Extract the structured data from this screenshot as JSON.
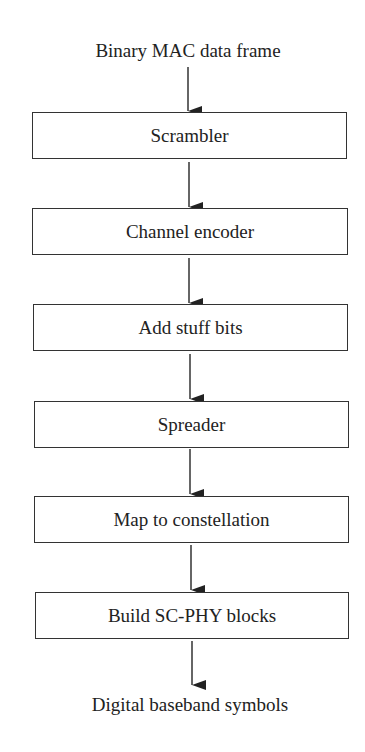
{
  "diagram": {
    "input_label": "Binary MAC data frame",
    "output_label": "Digital baseband symbols",
    "steps": [
      {
        "label": "Scrambler"
      },
      {
        "label": "Channel encoder"
      },
      {
        "label": "Add stuff bits"
      },
      {
        "label": "Spreader"
      },
      {
        "label": "Map to constellation"
      },
      {
        "label": "Build SC-PHY blocks"
      }
    ],
    "colors": {
      "line": "#333333",
      "background": "#ffffff",
      "text": "#222222"
    }
  }
}
